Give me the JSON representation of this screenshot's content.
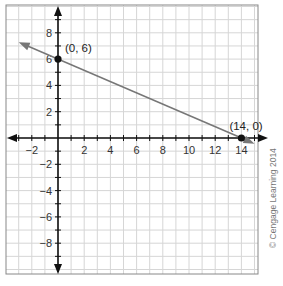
{
  "chart_data": {
    "type": "line",
    "title": "",
    "xlabel": "",
    "ylabel": "",
    "xlim": [
      -3,
      15
    ],
    "ylim": [
      -10,
      10
    ],
    "grid": true,
    "x_ticks": [
      -2,
      2,
      4,
      6,
      8,
      10,
      12,
      14
    ],
    "y_ticks": [
      8,
      6,
      4,
      2,
      -2,
      -4,
      -6,
      -8
    ],
    "series": [
      {
        "name": "line",
        "x": [
          -3,
          15
        ],
        "y": [
          7.29,
          -0.43
        ],
        "slope": -0.4286,
        "intercept": 6,
        "color": "#777777",
        "arrows": "both"
      }
    ],
    "points": [
      {
        "x": 0,
        "y": 6,
        "label": "(0, 6)"
      },
      {
        "x": 14,
        "y": 0,
        "label": "(14, 0)"
      }
    ],
    "annotations": [
      "© Cengage Learning 2014"
    ]
  },
  "credit": "© Cengage Learning 2014"
}
